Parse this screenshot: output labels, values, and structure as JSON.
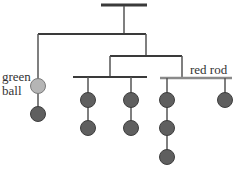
{
  "labels": {
    "green_line1": "green",
    "green_line2": "ball",
    "red_rod": "red rod"
  },
  "colors": {
    "rod": "#3a3a3a",
    "red_rod": "#8a8a8a",
    "string": "#555555",
    "green_ball": "#b5b5b5",
    "dark_ball": "#5f5f5f",
    "ball_outline": "#3e3e3e"
  },
  "mobile": {
    "top_rod": {
      "x1": 101,
      "x2": 147,
      "y": 5
    },
    "rods": [
      {
        "x1": 38,
        "x2": 146,
        "y": 34
      },
      {
        "x1": 110,
        "x2": 182,
        "y": 56
      },
      {
        "x1": 73,
        "x2": 147,
        "y": 77
      },
      {
        "x1": 160,
        "x2": 232,
        "y": 78,
        "name": "red rod"
      }
    ],
    "balls": [
      {
        "cx": 38,
        "cy": 86,
        "type": "green"
      },
      {
        "cx": 38,
        "cy": 114,
        "type": "dark"
      },
      {
        "cx": 88,
        "cy": 100,
        "type": "dark"
      },
      {
        "cx": 88,
        "cy": 128,
        "type": "dark"
      },
      {
        "cx": 131,
        "cy": 100,
        "type": "dark"
      },
      {
        "cx": 131,
        "cy": 128,
        "type": "dark"
      },
      {
        "cx": 167,
        "cy": 100,
        "type": "dark"
      },
      {
        "cx": 167,
        "cy": 128,
        "type": "dark"
      },
      {
        "cx": 167,
        "cy": 157,
        "type": "dark"
      },
      {
        "cx": 225,
        "cy": 100,
        "type": "dark"
      }
    ]
  }
}
